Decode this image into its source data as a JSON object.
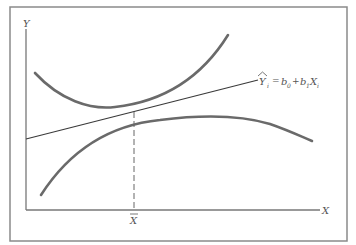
{
  "figure": {
    "axis_labels": {
      "y": "Y",
      "x": "X",
      "x_mean": "X"
    },
    "regression_equation": {
      "lhs": "Y",
      "lhs_subscript": "i",
      "equals": "=",
      "b0": "b",
      "b0_subscript": "0",
      "plus": "+",
      "b1": "b",
      "b1_subscript": "1",
      "x": "X",
      "x_subscript": "i"
    },
    "colors": {
      "frame": "#8a8a8a",
      "axis": "#777777",
      "curve": "#6a6a6a",
      "line": "#3a3a3a",
      "text": "#555555"
    }
  }
}
